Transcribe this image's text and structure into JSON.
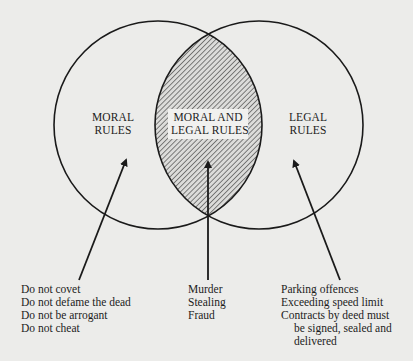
{
  "diagram": {
    "type": "venn",
    "sets": [
      {
        "label_line1": "MORAL",
        "label_line2": "RULES"
      },
      {
        "label_line1": "LEGAL",
        "label_line2": "RULES"
      }
    ],
    "intersection": {
      "label_line1": "MORAL AND",
      "label_line2": "LEGAL RULES",
      "fill": "hatched"
    },
    "colors": {
      "background": "#ececea",
      "stroke": "#1a1a1a"
    }
  },
  "examples": {
    "moral_only": [
      "Do not covet",
      "Do not defame the dead",
      "Do not be arrogant",
      "Do not cheat"
    ],
    "both": [
      "Murder",
      "Stealing",
      "Fraud"
    ],
    "legal_only": [
      "Parking offences",
      "Exceeding speed limit",
      "Contracts by deed must",
      "be signed, sealed and",
      "delivered"
    ]
  }
}
